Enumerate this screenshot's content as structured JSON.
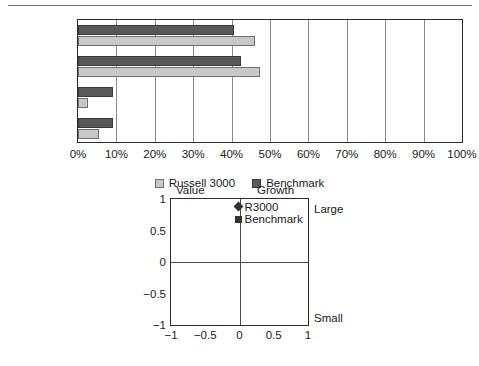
{
  "chart_data": [
    {
      "type": "bar",
      "orientation": "horizontal",
      "title": "",
      "xlabel": "",
      "ylabel": "",
      "categories": [
        "LgValue",
        "LgGrowth",
        "SmValue",
        "SmGrowth"
      ],
      "series": [
        {
          "name": "Russell 3000",
          "color": "#c8c8c8",
          "values": [
            46,
            47.5,
            2.5,
            5.5
          ]
        },
        {
          "name": "Benchmark",
          "color": "#595959",
          "values": [
            40.5,
            42.5,
            9,
            9
          ]
        }
      ],
      "xlim": [
        0,
        100
      ],
      "xticks": [
        0,
        10,
        20,
        30,
        40,
        50,
        60,
        70,
        80,
        90,
        100
      ],
      "xtick_labels": [
        "0%",
        "10%",
        "20%",
        "30%",
        "40%",
        "50%",
        "60%",
        "70%",
        "80%",
        "90%",
        "100%"
      ],
      "grid": "vertical",
      "legend_position": "bottom-center",
      "legend": [
        "Russell 3000",
        "Benchmark"
      ]
    },
    {
      "type": "scatter",
      "title": "",
      "xlabel": "",
      "ylabel": "",
      "xlim": [
        -1,
        1
      ],
      "ylim": [
        -1,
        1
      ],
      "xticks": [
        -1,
        -0.5,
        0,
        0.5,
        1
      ],
      "xtick_labels": [
        "−1",
        "−0.5",
        "0",
        "0.5",
        "1"
      ],
      "yticks": [
        -1,
        -0.5,
        0,
        0.5,
        1
      ],
      "ytick_labels": [
        "1",
        "0.5",
        "0",
        "−0.5",
        "−1"
      ],
      "grid": "quadrant-axes",
      "quadrant_labels": {
        "top_left": "Value",
        "top_right": "Growth",
        "right_top": "Large",
        "right_bottom": "Small"
      },
      "points": [
        {
          "name": "R3000",
          "marker": "diamond",
          "x": 0,
          "y": 0.88,
          "color": "#333333"
        },
        {
          "name": "Benchmark",
          "marker": "square",
          "x": 0,
          "y": 0.68,
          "color": "#333333"
        }
      ]
    }
  ],
  "bar_chart": {
    "categories": [
      {
        "label": "LgValue"
      },
      {
        "label": "LgGrowth"
      },
      {
        "label": "SmValue"
      },
      {
        "label": "SmGrowth"
      }
    ],
    "xtick_labels": [
      "0%",
      "10%",
      "20%",
      "30%",
      "40%",
      "50%",
      "60%",
      "70%",
      "80%",
      "90%",
      "100%"
    ],
    "legend": [
      {
        "label": "Russell 3000"
      },
      {
        "label": "Benchmark"
      }
    ]
  },
  "style_box": {
    "ytick_labels": [
      "1",
      "0.5",
      "0",
      "−0.5",
      "−1"
    ],
    "xtick_labels": [
      "−1",
      "−0.5",
      "0",
      "0.5",
      "1"
    ],
    "corner_value": "Value",
    "corner_growth": "Growth",
    "corner_large": "Large",
    "corner_small": "Small",
    "points": [
      {
        "label": "R3000"
      },
      {
        "label": "Benchmark"
      }
    ]
  }
}
